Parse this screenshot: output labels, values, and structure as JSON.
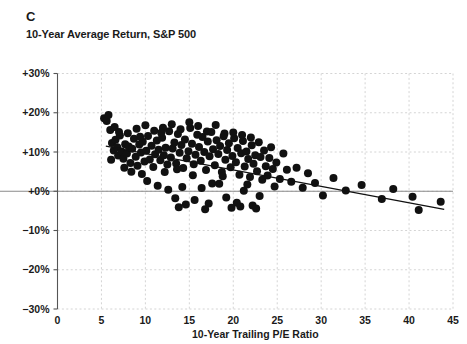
{
  "panel": {
    "letter": "C",
    "subtitle": "10-Year Average Return, S&P 500"
  },
  "axis": {
    "x_title": "10-Year Trailing P/E Ratio",
    "y_title": ""
  },
  "chart_data": {
    "type": "scatter",
    "title": "C",
    "subtitle": "10-Year Average Return, S&P 500",
    "xlabel": "10-Year Trailing P/E Ratio",
    "ylabel": "",
    "xlim": [
      0,
      45
    ],
    "ylim": [
      -30,
      30
    ],
    "xticks": [
      0,
      5,
      10,
      15,
      20,
      25,
      30,
      35,
      40,
      45
    ],
    "yticks": [
      -30,
      -20,
      -10,
      0,
      10,
      20,
      30
    ],
    "xtick_labels": [
      "0",
      "5",
      "10",
      "15",
      "20",
      "25",
      "30",
      "35",
      "40",
      "45"
    ],
    "ytick_labels": [
      "-30%",
      "-20%",
      "-10%",
      "+0%",
      "+10%",
      "+20%",
      "+30%"
    ],
    "grid": true,
    "grid_style": "dashed",
    "grid_color": "#c9c9c9",
    "zero_line": true,
    "zero_line_color": "#8a8a8a",
    "legend": false,
    "marker_color": "#111111",
    "marker_size_px": 8,
    "series": [
      {
        "name": "10-Year Average Return vs 10-Year Trailing P/E",
        "points": [
          [
            5.3,
            18.6
          ],
          [
            5.6,
            17.9
          ],
          [
            5.8,
            19.4
          ],
          [
            6.0,
            15.6
          ],
          [
            6.2,
            12.3
          ],
          [
            6.4,
            10.4
          ],
          [
            6.6,
            13.1
          ],
          [
            6.8,
            11.2
          ],
          [
            6.9,
            9.1
          ],
          [
            7.1,
            14.2
          ],
          [
            7.3,
            10.1
          ],
          [
            7.5,
            8.3
          ],
          [
            7.7,
            12.0
          ],
          [
            7.9,
            9.6
          ],
          [
            8.1,
            11.4
          ],
          [
            8.3,
            7.2
          ],
          [
            8.5,
            10.8
          ],
          [
            8.7,
            13.4
          ],
          [
            8.9,
            8.8
          ],
          [
            9.1,
            6.5
          ],
          [
            9.3,
            11.9
          ],
          [
            9.5,
            9.9
          ],
          [
            9.7,
            12.6
          ],
          [
            9.9,
            7.6
          ],
          [
            10.1,
            10.3
          ],
          [
            10.3,
            14.1
          ],
          [
            10.5,
            8.1
          ],
          [
            10.7,
            11.6
          ],
          [
            10.9,
            6.2
          ],
          [
            11.1,
            9.4
          ],
          [
            11.3,
            12.9
          ],
          [
            11.5,
            10.6
          ],
          [
            11.7,
            7.9
          ],
          [
            11.9,
            13.6
          ],
          [
            12.1,
            9.2
          ],
          [
            12.3,
            11.1
          ],
          [
            12.5,
            6.8
          ],
          [
            12.7,
            15.3
          ],
          [
            12.9,
            8.6
          ],
          [
            13.1,
            10.9
          ],
          [
            13.3,
            12.4
          ],
          [
            13.5,
            7.1
          ],
          [
            13.7,
            14.6
          ],
          [
            13.9,
            9.8
          ],
          [
            14.1,
            11.8
          ],
          [
            14.3,
            5.9
          ],
          [
            14.5,
            13.2
          ],
          [
            14.7,
            8.4
          ],
          [
            14.9,
            10.2
          ],
          [
            15.1,
            16.1
          ],
          [
            15.3,
            12.1
          ],
          [
            15.5,
            6.9
          ],
          [
            15.7,
            9.3
          ],
          [
            15.9,
            14.4
          ],
          [
            16.1,
            11.3
          ],
          [
            16.3,
            7.8
          ],
          [
            16.5,
            13.8
          ],
          [
            16.7,
            10.0
          ],
          [
            16.9,
            5.4
          ],
          [
            17.1,
            12.7
          ],
          [
            17.3,
            8.9
          ],
          [
            17.5,
            15.1
          ],
          [
            17.7,
            10.7
          ],
          [
            17.9,
            6.6
          ],
          [
            18.1,
            13.0
          ],
          [
            18.3,
            9.5
          ],
          [
            18.5,
            11.5
          ],
          [
            18.7,
            4.9
          ],
          [
            18.9,
            14.0
          ],
          [
            19.1,
            8.0
          ],
          [
            19.3,
            10.5
          ],
          [
            19.5,
            12.2
          ],
          [
            19.7,
            6.1
          ],
          [
            19.9,
            9.0
          ],
          [
            20.1,
            13.5
          ],
          [
            20.3,
            7.4
          ],
          [
            20.5,
            11.0
          ],
          [
            20.7,
            4.2
          ],
          [
            20.9,
            9.7
          ],
          [
            21.1,
            12.8
          ],
          [
            21.3,
            6.3
          ],
          [
            21.5,
            10.1
          ],
          [
            21.7,
            8.2
          ],
          [
            21.9,
            3.6
          ],
          [
            22.1,
            11.7
          ],
          [
            22.3,
            7.0
          ],
          [
            22.5,
            9.2
          ],
          [
            22.7,
            5.1
          ],
          [
            22.9,
            12.5
          ],
          [
            23.1,
            8.7
          ],
          [
            23.3,
            2.9
          ],
          [
            23.5,
            10.4
          ],
          [
            23.7,
            6.4
          ],
          [
            23.9,
            4.0
          ],
          [
            24.1,
            8.5
          ],
          [
            24.3,
            11.2
          ],
          [
            24.5,
            5.7
          ],
          [
            24.9,
            7.3
          ],
          [
            25.3,
            3.1
          ],
          [
            25.7,
            9.6
          ],
          [
            26.1,
            5.5
          ],
          [
            26.6,
            2.4
          ],
          [
            27.2,
            6.0
          ],
          [
            27.9,
            0.9
          ],
          [
            28.5,
            4.6
          ],
          [
            29.3,
            2.1
          ],
          [
            30.2,
            -1.1
          ],
          [
            31.4,
            3.4
          ],
          [
            32.8,
            0.2
          ],
          [
            34.6,
            1.6
          ],
          [
            36.9,
            -2.0
          ],
          [
            38.2,
            0.6
          ],
          [
            40.4,
            -1.4
          ],
          [
            41.1,
            -4.8
          ],
          [
            43.6,
            -2.7
          ],
          [
            6.5,
            16.4
          ],
          [
            7.0,
            15.1
          ],
          [
            8.0,
            14.8
          ],
          [
            9.0,
            15.9
          ],
          [
            10.0,
            16.8
          ],
          [
            11.0,
            15.4
          ],
          [
            12.0,
            16.2
          ],
          [
            13.0,
            17.1
          ],
          [
            14.0,
            15.8
          ],
          [
            15.0,
            17.6
          ],
          [
            16.0,
            16.6
          ],
          [
            17.0,
            15.2
          ],
          [
            18.0,
            16.9
          ],
          [
            19.0,
            14.7
          ],
          [
            20.0,
            15.0
          ],
          [
            21.0,
            14.3
          ],
          [
            22.0,
            13.7
          ],
          [
            10.2,
            2.6
          ],
          [
            11.4,
            1.4
          ],
          [
            12.6,
            0.4
          ],
          [
            13.4,
            -1.8
          ],
          [
            14.2,
            1.1
          ],
          [
            15.6,
            -2.2
          ],
          [
            16.4,
            0.8
          ],
          [
            17.2,
            -3.1
          ],
          [
            18.4,
            1.9
          ],
          [
            19.2,
            -1.6
          ],
          [
            20.4,
            -2.9
          ],
          [
            21.2,
            0.1
          ],
          [
            22.2,
            -3.6
          ],
          [
            23.0,
            -1.2
          ],
          [
            13.8,
            -4.1
          ],
          [
            14.6,
            -3.4
          ],
          [
            16.8,
            -4.6
          ],
          [
            19.8,
            -4.2
          ],
          [
            20.8,
            -3.9
          ],
          [
            22.6,
            -4.4
          ],
          [
            8.4,
            5.0
          ],
          [
            9.6,
            4.4
          ],
          [
            12.2,
            4.9
          ],
          [
            15.4,
            4.1
          ],
          [
            18.8,
            3.8
          ],
          [
            6.1,
            8.0
          ],
          [
            7.6,
            6.0
          ],
          [
            9.4,
            13.9
          ],
          [
            11.8,
            14.9
          ],
          [
            13.6,
            5.6
          ],
          [
            17.6,
            2.0
          ],
          [
            21.6,
            1.7
          ],
          [
            24.7,
            1.2
          ]
        ]
      }
    ],
    "trendline": {
      "type": "linear",
      "x_start": 5.5,
      "y_start": 11.5,
      "x_end": 44.0,
      "y_end": -4.6,
      "color": "#111111"
    }
  }
}
